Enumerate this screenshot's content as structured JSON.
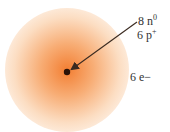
{
  "diagram": {
    "labels": {
      "neutrons": {
        "count": "8 n",
        "sup": "0"
      },
      "protons": {
        "count": "6 p",
        "sup": "+"
      },
      "electrons": "6 e−"
    },
    "colors": {
      "cloud": "#f27828",
      "nucleus": "#2a1208",
      "arrow": "#3a2a20",
      "text": "#333333"
    }
  }
}
